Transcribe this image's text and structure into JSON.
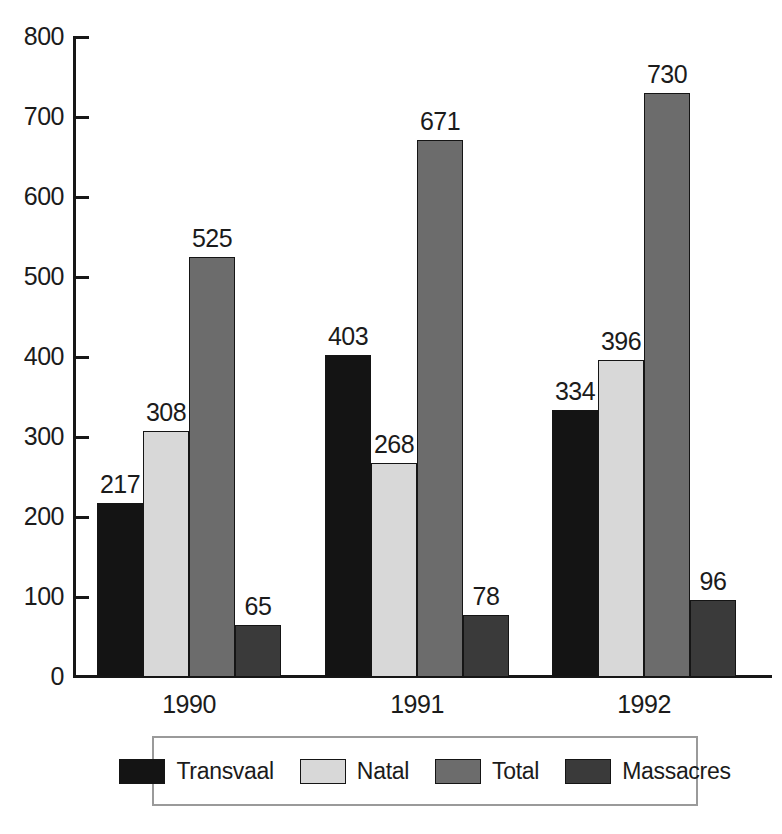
{
  "chart_data": {
    "type": "bar",
    "title": "",
    "subtitle": "",
    "xlabel": "",
    "ylabel": "",
    "categories": [
      "1990",
      "1991",
      "1992"
    ],
    "series": [
      {
        "name": "Transvaal",
        "values": [
          217,
          403,
          334
        ],
        "color": "#141414"
      },
      {
        "name": "Natal",
        "values": [
          308,
          268,
          396
        ],
        "color": "#d8d8d8"
      },
      {
        "name": "Total",
        "values": [
          525,
          671,
          730
        ],
        "color": "#6c6c6c"
      },
      {
        "name": "Massacres",
        "values": [
          65,
          78,
          96
        ],
        "color": "#3a3a3a"
      }
    ],
    "ylim": [
      0,
      800
    ],
    "ytick_step": 100,
    "yticks": [
      0,
      100,
      200,
      300,
      400,
      500,
      600,
      700,
      800
    ],
    "ytick_labels": [
      "0",
      "100",
      "200",
      "300",
      "400",
      "500",
      "600",
      "700",
      "800"
    ],
    "grid": false,
    "data_labels": true,
    "legend_position": "bottom",
    "legend_entries": [
      "Transvaal",
      "Natal",
      "Total",
      "Massacres"
    ],
    "annotations": []
  },
  "axis": {
    "y_labels": [
      "800",
      "700",
      "600",
      "500",
      "400",
      "300",
      "200",
      "100",
      "0"
    ],
    "x_labels": [
      "1990",
      "1991",
      "1992"
    ]
  },
  "bar_labels": {
    "g0": [
      "217",
      "308",
      "525",
      "65"
    ],
    "g1": [
      "403",
      "268",
      "671",
      "78"
    ],
    "g2": [
      "334",
      "396",
      "730",
      "96"
    ]
  },
  "legend": {
    "items": [
      {
        "label": "Transvaal"
      },
      {
        "label": "Natal"
      },
      {
        "label": "Total"
      },
      {
        "label": "Massacres"
      }
    ]
  }
}
